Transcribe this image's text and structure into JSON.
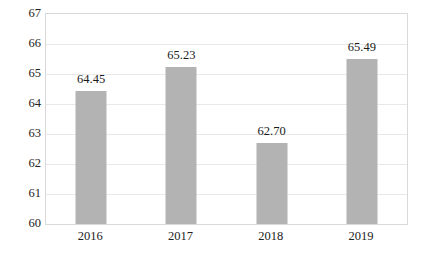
{
  "chart_data": {
    "type": "bar",
    "title": "",
    "subtitle": "",
    "xlabel": "",
    "ylabel": "",
    "categories": [
      "2016",
      "2017",
      "2018",
      "2019"
    ],
    "values": [
      64.45,
      65.23,
      62.7,
      65.49
    ],
    "data_labels": [
      "64.45",
      "65.23",
      "62.70",
      "65.49"
    ],
    "ylim": [
      60,
      67
    ],
    "ytick_labels": [
      "60",
      "61",
      "62",
      "63",
      "64",
      "65",
      "66",
      "67"
    ],
    "ytick_values": [
      60,
      61,
      62,
      63,
      64,
      65,
      66,
      67
    ],
    "grid": true,
    "grid_axis": "y",
    "legend": false,
    "legend_position": "none",
    "series": [
      {
        "name": "",
        "values": [
          64.45,
          65.23,
          62.7,
          65.49
        ],
        "color": "#b3b3b3"
      }
    ],
    "colors": {
      "bar_fill": "#b3b3b3",
      "gridline": "#e8e8e8",
      "plot_border": "#d9d9d9",
      "text": "#222222",
      "background": "#ffffff"
    }
  }
}
